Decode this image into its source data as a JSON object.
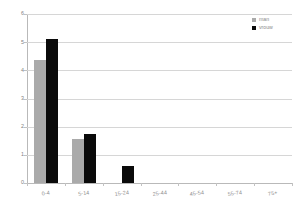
{
  "chart_data": {
    "type": "bar",
    "title": "",
    "subtitle": "",
    "xlabel": "",
    "ylabel": "",
    "categories": [
      "0-4",
      "5-14",
      "15-24",
      "25-44",
      "45-54",
      "55-74",
      "75+"
    ],
    "series": [
      {
        "name": "man",
        "color": "#aaaaaa",
        "values": [
          4.35,
          1.55,
          0,
          0,
          0,
          0,
          0
        ]
      },
      {
        "name": "vrouw",
        "color": "#0a0a0a",
        "values": [
          5.1,
          1.75,
          0.6,
          0,
          0,
          0,
          0
        ]
      }
    ],
    "ylim": [
      0,
      6
    ],
    "yticks": [
      "0",
      "1",
      "2",
      "3",
      "4",
      "5",
      "6"
    ],
    "grid": true,
    "legend_position": "top-right"
  },
  "axis": {
    "y_tick_labels": [
      "6",
      "5",
      "4",
      "3",
      "2",
      "1",
      "0"
    ],
    "x_tick_labels": [
      "0-4",
      "5-14",
      "15-24",
      "25-44",
      "45-54",
      "55-74",
      "75+"
    ]
  },
  "legend": {
    "items": [
      {
        "label": "man"
      },
      {
        "label": "vrouw"
      }
    ]
  },
  "colors": {
    "men": "#aaaaaa",
    "women": "#0a0a0a",
    "grid": "#d6d6d6",
    "axis": "#b9b9b9",
    "text": "#8a8a8a",
    "background": "#ffffff"
  }
}
